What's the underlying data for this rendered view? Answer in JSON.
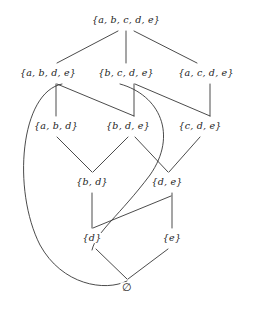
{
  "figure": {
    "type": "hasse-diagram",
    "title": "",
    "background_color": "#ffffff",
    "line_color": "#2b2b2b",
    "text_color": "#1c1c1c"
  },
  "nodes": [
    {
      "id": "abcde",
      "label": "{a, b, c, d, e}",
      "x": 126,
      "y": 20,
      "level": 0
    },
    {
      "id": "abde",
      "label": "{a, b, d, e}",
      "x": 48,
      "y": 73,
      "level": 1
    },
    {
      "id": "bcde",
      "label": "{b, c, d, e}",
      "x": 126,
      "y": 73,
      "level": 1
    },
    {
      "id": "acde",
      "label": "{a, c, d, e}",
      "x": 206,
      "y": 73,
      "level": 1
    },
    {
      "id": "abd",
      "label": "{a, b, d}",
      "x": 56,
      "y": 126,
      "level": 2
    },
    {
      "id": "bde",
      "label": "{b, d, e}",
      "x": 128,
      "y": 126,
      "level": 2
    },
    {
      "id": "cde",
      "label": "{c, d, e}",
      "x": 200,
      "y": 126,
      "level": 2
    },
    {
      "id": "bd",
      "label": "{b, d}",
      "x": 92,
      "y": 182,
      "level": 3
    },
    {
      "id": "de",
      "label": "{d, e}",
      "x": 167,
      "y": 182,
      "level": 3
    },
    {
      "id": "d",
      "label": "{d}",
      "x": 92,
      "y": 238,
      "level": 4
    },
    {
      "id": "e",
      "label": "{e}",
      "x": 172,
      "y": 238,
      "level": 4
    },
    {
      "id": "empty",
      "label": "∅",
      "x": 127,
      "y": 288,
      "level": 5
    }
  ],
  "edges": [
    {
      "from": "abcde",
      "to": "abde",
      "shape": "line",
      "d": "M 118 31 L 57 63"
    },
    {
      "from": "abcde",
      "to": "bcde",
      "shape": "line",
      "d": "M 126 31 L 126 63"
    },
    {
      "from": "abcde",
      "to": "acde",
      "shape": "line",
      "d": "M 134 31 L 197 63"
    },
    {
      "from": "abde",
      "to": "abd",
      "shape": "line",
      "d": "M 56 84 L 56 116"
    },
    {
      "from": "abde",
      "to": "bde",
      "shape": "line",
      "d": "M 57 84 L 134 116"
    },
    {
      "from": "bcde",
      "to": "bde",
      "shape": "line",
      "d": "M 134 84 L 134 116"
    },
    {
      "from": "bcde",
      "to": "cde",
      "shape": "line",
      "d": "M 135 84 L 210 116"
    },
    {
      "from": "acde",
      "to": "cde",
      "shape": "line",
      "d": "M 210 84 L 210 116"
    },
    {
      "from": "abd",
      "to": "bd",
      "shape": "line",
      "d": "M 57 137 L 92 172"
    },
    {
      "from": "bde",
      "to": "bd",
      "shape": "line",
      "d": "M 128 137 L 93 172"
    },
    {
      "from": "bde",
      "to": "de",
      "shape": "line",
      "d": "M 135 137 L 168 172"
    },
    {
      "from": "cde",
      "to": "de",
      "shape": "line",
      "d": "M 200 137 L 169 172"
    },
    {
      "from": "bd",
      "to": "d",
      "shape": "line",
      "d": "M 92 193 L 92 228"
    },
    {
      "from": "de",
      "to": "e",
      "shape": "line",
      "d": "M 172 193 L 172 228"
    },
    {
      "from": "de",
      "to": "d",
      "shape": "line",
      "d": "M 171 196 L 93 228"
    },
    {
      "from": "d",
      "to": "empty",
      "shape": "line",
      "d": "M 96 249 L 127 279"
    },
    {
      "from": "e",
      "to": "empty",
      "shape": "line",
      "d": "M 168 249 L 128 279"
    },
    {
      "from": "abde",
      "to": "empty",
      "shape": "curve",
      "d": "M 62 84 C 20 92, 12 190, 40 245 C 62 285, 105 292, 127 281"
    },
    {
      "from": "bcde",
      "to": "d",
      "shape": "curve",
      "d": "M 120 84 C 160 95, 178 135, 150 175 C 120 215, 96 232, 92 250"
    }
  ]
}
